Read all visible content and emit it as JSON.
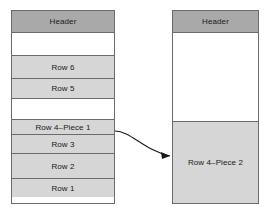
{
  "diagram": {
    "colors": {
      "header_fill": "#a9a9a9",
      "row_fill": "#d6d6d6",
      "free_space_fill": "#ffffff",
      "border": "#6b6b6b",
      "connector": "#1a1a1a",
      "text": "#1a1a1a"
    },
    "blocks": [
      {
        "id": "left-block",
        "name": "left-data-block",
        "cells": [
          {
            "kind": "header",
            "label": "Header",
            "height": 22
          },
          {
            "kind": "free-space",
            "label": "",
            "height": 23
          },
          {
            "kind": "row",
            "label": "Row 6",
            "height": 23
          },
          {
            "kind": "row",
            "label": "Row 5",
            "height": 20
          },
          {
            "kind": "free-space",
            "label": "",
            "height": 21
          },
          {
            "kind": "row",
            "label": "Row 4–Piece 1",
            "height": 15
          },
          {
            "kind": "row",
            "label": "Row 3",
            "height": 19
          },
          {
            "kind": "row",
            "label": "Row 2",
            "height": 25
          },
          {
            "kind": "row",
            "label": "Row 1",
            "height": 18
          }
        ]
      },
      {
        "id": "right-block",
        "name": "right-data-block",
        "cells": [
          {
            "kind": "header",
            "label": "Header",
            "height": 22
          },
          {
            "kind": "free-space",
            "label": "",
            "height": 89
          },
          {
            "kind": "row",
            "label": "Row 4–Piece 2",
            "height": 81
          }
        ]
      }
    ],
    "connector": {
      "name": "row-chain-pointer",
      "from": "Row 4–Piece 1",
      "to": "Row 4–Piece 2",
      "path": "M 115 131 C 131 131, 143 150, 170 156",
      "arrowhead": "M 170 156 L 161 152 L 162 159 Z"
    }
  }
}
